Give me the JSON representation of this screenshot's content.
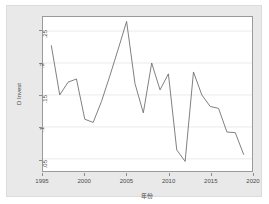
{
  "chart_data": {
    "type": "line",
    "title": "",
    "subtitle": "",
    "xlabel": "年份",
    "ylabel": "D Invest",
    "xlim": [
      1995,
      2020
    ],
    "ylim": [
      0.031,
      0.272
    ],
    "grid": true,
    "grid_axis": "y",
    "legend": "none",
    "line_color": "#707070",
    "x": [
      1996,
      1997,
      1998,
      1999,
      2000,
      2001,
      2002,
      2003,
      2004,
      2005,
      2006,
      2007,
      2008,
      2009,
      2010,
      2011,
      2012,
      2013,
      2014,
      2015,
      2016,
      2017,
      2018,
      2019
    ],
    "values": [
      0.227,
      0.15,
      0.17,
      0.175,
      0.112,
      0.107,
      0.14,
      0.18,
      0.222,
      0.265,
      0.168,
      0.122,
      0.2,
      0.158,
      0.183,
      0.064,
      0.046,
      0.186,
      0.15,
      0.132,
      0.129,
      0.092,
      0.091,
      0.057
    ],
    "series": [
      {
        "name": "D Invest",
        "values": [
          0.227,
          0.15,
          0.17,
          0.175,
          0.112,
          0.107,
          0.14,
          0.18,
          0.222,
          0.265,
          0.168,
          0.122,
          0.2,
          0.158,
          0.183,
          0.064,
          0.046,
          0.186,
          0.15,
          0.132,
          0.129,
          0.092,
          0.091,
          0.057
        ]
      }
    ],
    "xticks": [
      1995,
      2000,
      2005,
      2010,
      2015,
      2020
    ],
    "xtick_labels": [
      "1995",
      "2000",
      "2005",
      "2010",
      "2015",
      "2020"
    ],
    "yticks": [
      0.05,
      0.1,
      0.15,
      0.2,
      0.25
    ],
    "ytick_labels": [
      ".05",
      ".1",
      ".15",
      ".2",
      ".25"
    ]
  },
  "axes": {
    "y_title": "D Invest",
    "x_title": "年份"
  }
}
